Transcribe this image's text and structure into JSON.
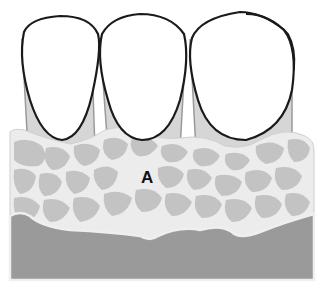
{
  "diagram": {
    "type": "dental cross-section illustration",
    "labels": [
      {
        "id": "A",
        "text": "A",
        "x": 141,
        "y": 168
      }
    ],
    "teeth": [
      {
        "name": "left-tooth-crown"
      },
      {
        "name": "middle-tooth-crown"
      },
      {
        "name": "right-tooth-crown"
      }
    ],
    "layers": [
      {
        "name": "root-sheath",
        "color": "#d0d0d0"
      },
      {
        "name": "cellular-tissue",
        "color": "#c4c4c4",
        "outline": "#efefef"
      },
      {
        "name": "base-layer",
        "color": "#999999"
      }
    ],
    "colors": {
      "background": "#ffffff",
      "crown_fill": "#ffffff",
      "crown_outline": "#1a1a1a",
      "root": "#d4d4d4",
      "tissue_bg": "#ececec",
      "cell": "#c2c2c2",
      "base": "#9a9a9a"
    }
  }
}
